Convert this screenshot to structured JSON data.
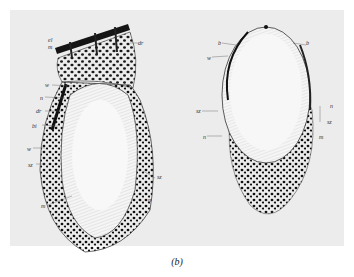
{
  "figure": {
    "caption": "(b)",
    "left_drawing": {
      "labels": {
        "el": "el",
        "m_top": "m",
        "dr_top": "dr",
        "w": "w",
        "n_upper": "n",
        "dr_mid": "dr",
        "bi": "bi",
        "w_lower": "w",
        "sz_left": "sz",
        "m_bottom": "m",
        "sz_right": "sz",
        "n_right": "n"
      }
    },
    "right_drawing": {
      "labels": {
        "b_left": "b",
        "b_right": "b",
        "w": "w",
        "sz_left": "sz",
        "n_right": "n",
        "sz_right": "sz",
        "n_left": "n",
        "m": "m"
      }
    },
    "colors": {
      "plate": "#ececec",
      "ink": "#1a1a1a",
      "cell_fill": "#f7f7f7"
    }
  }
}
